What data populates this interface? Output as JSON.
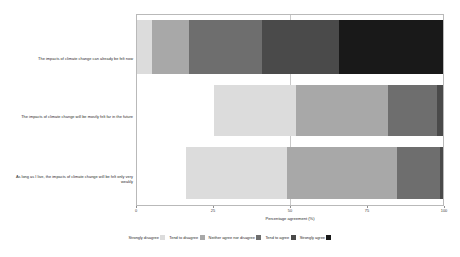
{
  "chart_data": {
    "type": "bar",
    "title": "",
    "subtitle": "",
    "xlabel": "Percentage agreement (%)",
    "ylabel": "",
    "orientation": "horizontal",
    "stacked": true,
    "diverging": true,
    "xlim": [
      0,
      100
    ],
    "xticks": [
      "0",
      "25",
      "50",
      "75",
      "100"
    ],
    "xtick_values": [
      0,
      25,
      50,
      75,
      100
    ],
    "grid": false,
    "center_reference_line": 50,
    "legend_position": "bottom",
    "categories": [
      "The impacts of climate change can already be felt now",
      "The impacts of climate change will be mostly felt far in the future",
      "As long as I live, the impacts of climate change will be felt only very weakly"
    ],
    "series": [
      {
        "name": "Strongly disagree",
        "color": "#dcdcdc",
        "values": [
          5,
          25,
          16
        ]
      },
      {
        "name": "Tend to disagree",
        "color": "#a8a8a8",
        "values": [
          12,
          27,
          33
        ]
      },
      {
        "name": "Neither agree nor disagree",
        "color": "#6e6e6e",
        "values": [
          24,
          30,
          36
        ]
      },
      {
        "name": "Tend to agree",
        "color": "#4a4a4a",
        "values": [
          25,
          16,
          14
        ]
      },
      {
        "name": "Strongly agree",
        "color": "#191919",
        "values": [
          34,
          2,
          1
        ]
      }
    ],
    "bar_offsets": [
      0,
      25,
      16
    ],
    "bars": [
      {
        "category": "The impacts of climate change can already be felt now",
        "offset": 0,
        "segments": [
          {
            "label": "Strongly disagree",
            "value": 5,
            "color": "#dcdcdc"
          },
          {
            "label": "Tend to disagree",
            "value": 12,
            "color": "#a8a8a8"
          },
          {
            "label": "Neither agree nor disagree",
            "value": 24,
            "color": "#6e6e6e"
          },
          {
            "label": "Tend to agree",
            "value": 25,
            "color": "#4a4a4a"
          },
          {
            "label": "Strongly agree",
            "value": 34,
            "color": "#191919"
          }
        ]
      },
      {
        "category": "The impacts of climate change will be mostly felt far in the future",
        "offset": 25,
        "segments": [
          {
            "label": "Strongly disagree",
            "value": 27,
            "color": "#dcdcdc"
          },
          {
            "label": "Tend to disagree",
            "value": 30,
            "color": "#a8a8a8"
          },
          {
            "label": "Neither agree nor disagree",
            "value": 16,
            "color": "#6e6e6e"
          },
          {
            "label": "Tend to agree",
            "value": 2,
            "color": "#4a4a4a"
          },
          {
            "label": "Strongly agree",
            "value": 0,
            "color": "#191919"
          }
        ]
      },
      {
        "category": "As long as I live, the impacts of climate change will be felt only very weakly",
        "offset": 16,
        "segments": [
          {
            "label": "Strongly disagree",
            "value": 33,
            "color": "#dcdcdc"
          },
          {
            "label": "Tend to disagree",
            "value": 36,
            "color": "#a8a8a8"
          },
          {
            "label": "Neither agree nor disagree",
            "value": 14,
            "color": "#6e6e6e"
          },
          {
            "label": "Tend to agree",
            "value": 1,
            "color": "#4a4a4a"
          },
          {
            "label": "Strongly agree",
            "value": 0,
            "color": "#191919"
          }
        ]
      }
    ]
  },
  "axis": {
    "x_title": "Percentage agreement (%)",
    "ticks": [
      {
        "label": "0",
        "value": 0
      },
      {
        "label": "25",
        "value": 25
      },
      {
        "label": "50",
        "value": 50
      },
      {
        "label": "75",
        "value": 75
      },
      {
        "label": "100",
        "value": 100
      }
    ]
  },
  "legend": {
    "items": [
      {
        "label": "Strongly disagree",
        "color": "#dcdcdc"
      },
      {
        "label": "Tend to disagree",
        "color": "#a8a8a8"
      },
      {
        "label": "Neither agree nor disagree",
        "color": "#6e6e6e"
      },
      {
        "label": "Tend to agree",
        "color": "#4a4a4a"
      },
      {
        "label": "Strongly agree",
        "color": "#191919"
      }
    ]
  },
  "colors": {
    "panel_border": "#b9b9b9",
    "reference_line": "#c9c9c9",
    "text": "#2a2a2a",
    "background": "#ffffff"
  }
}
